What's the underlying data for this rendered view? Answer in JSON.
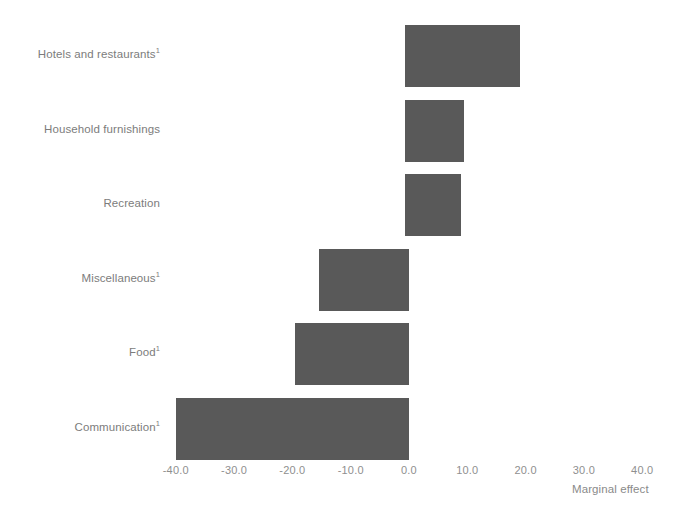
{
  "chart_data": {
    "type": "bar",
    "orientation": "horizontal",
    "title": "",
    "subtitle": "",
    "xlabel": "Marginal effect",
    "ylabel": "",
    "xlim": [
      -45.0,
      45.0
    ],
    "xticks": [
      "-40.0",
      "-30.0",
      "-20.0",
      "-10.0",
      "0.0",
      "10.0",
      "20.0",
      "30.0",
      "40.0"
    ],
    "xtick_values": [
      -40,
      -30,
      -20,
      -10,
      0,
      10,
      20,
      30,
      40
    ],
    "grid": false,
    "legend": false,
    "bar_color": "#595959",
    "categories": [
      "Hotels and restaurants¹",
      "Household furnishings",
      "Recreation",
      "Miscellaneous¹",
      "Food¹",
      "Communication¹"
    ],
    "values": [
      19.0,
      9.5,
      9.0,
      -15.5,
      -19.5,
      -40.0
    ],
    "bars": [
      {
        "label": "Hotels and restaurants",
        "footnote": "1",
        "value": 19.0
      },
      {
        "label": "Household furnishings",
        "footnote": "",
        "value": 9.5
      },
      {
        "label": "Recreation",
        "footnote": "",
        "value": 9.0
      },
      {
        "label": "Miscellaneous",
        "footnote": "1",
        "value": -15.5
      },
      {
        "label": "Food",
        "footnote": "1",
        "value": -19.5
      },
      {
        "label": "Communication",
        "footnote": "1",
        "value": -40.0
      }
    ]
  },
  "axis": {
    "x_title": "Marginal effect",
    "ticks": [
      {
        "label": "-40.0",
        "value": -40
      },
      {
        "label": "-30.0",
        "value": -30
      },
      {
        "label": "-20.0",
        "value": -20
      },
      {
        "label": "-10.0",
        "value": -10
      },
      {
        "label": "0.0",
        "value": 0
      },
      {
        "label": "10.0",
        "value": 10
      },
      {
        "label": "20.0",
        "value": 20
      },
      {
        "label": "30.0",
        "value": 30
      },
      {
        "label": "40.0",
        "value": 40
      }
    ]
  },
  "colors": {
    "bar": "#595959",
    "text": "#7c7c7c",
    "background": "#ffffff"
  }
}
